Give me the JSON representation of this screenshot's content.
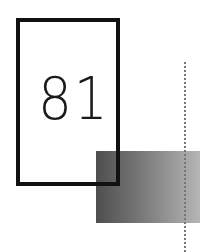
{
  "graphic": {
    "number": "81",
    "colors": {
      "frame": "#111111",
      "gradient_start": "#4e4e4e",
      "gradient_end": "#b5b5b5",
      "dotted_line": "#777777"
    }
  }
}
